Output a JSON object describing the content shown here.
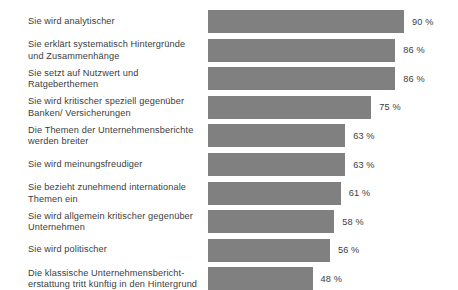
{
  "chart_data": {
    "type": "bar",
    "orientation": "horizontal",
    "title": "",
    "subtitle": "",
    "xlabel": "",
    "ylabel": "",
    "xlim": [
      0,
      100
    ],
    "grid": false,
    "legend": null,
    "value_suffix": "%",
    "bar_color": "#808080",
    "text_color": "#3c3c3c",
    "background_color": "#ffffff",
    "categories": [
      "Sie wird analytischer",
      "Sie erklärt systematisch Hintergründe\nund Zusammenhänge",
      "Sie setzt auf Nutzwert und\nRatgeberthemen",
      "Sie wird kritischer speziell gegenüber\nBanken/ Versicherungen",
      "Die Themen der Unternehmensberichte\nwerden breiter",
      "Sie wird meinungsfreudiger",
      "Sie bezieht zunehmend internationale\nThemen ein",
      "Sie wird allgemein kritischer gegenüber\nUnternehmen",
      "Sie wird politischer",
      "Die klassische Unternehmensbericht-\nerstattung tritt künftig in den Hintergrund"
    ],
    "values": [
      90,
      86,
      86,
      75,
      63,
      63,
      61,
      58,
      56,
      48
    ],
    "value_labels": [
      "90 %",
      "86 %",
      "86 %",
      "75 %",
      "63 %",
      "63 %",
      "61 %",
      "58 %",
      "56 %",
      "48 %"
    ]
  }
}
